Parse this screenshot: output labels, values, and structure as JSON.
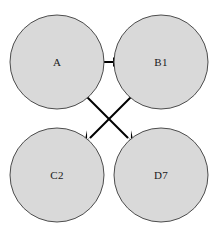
{
  "diagram": {
    "background_color": "#ffffff",
    "node_fill_color": "#d9d9d9",
    "node_stroke_color": "#4d4d4d",
    "edge_color": "#000000",
    "label_color": "#1a1a1a",
    "nodes": [
      {
        "id": "A",
        "label": "A",
        "cx": 57,
        "cy": 62,
        "r": 47
      },
      {
        "id": "B1",
        "label": "B1",
        "cx": 161,
        "cy": 62,
        "r": 47
      },
      {
        "id": "C2",
        "label": "C2",
        "cx": 57,
        "cy": 175,
        "r": 47
      },
      {
        "id": "D7",
        "label": "D7",
        "cx": 161,
        "cy": 175,
        "r": 47
      }
    ],
    "edges": [
      {
        "id": "a-to-b1",
        "from": "A",
        "to": "B1",
        "directed": true,
        "x1": 95,
        "y1": 62,
        "x2": 122,
        "y2": 62
      },
      {
        "id": "a-to-d7",
        "from": "A",
        "to": "D7",
        "directed": true,
        "x1": 84,
        "y1": 94,
        "x2": 133,
        "y2": 143
      },
      {
        "id": "b1-to-c2",
        "from": "B1",
        "to": "C2",
        "directed": true,
        "x1": 134,
        "y1": 94,
        "x2": 85,
        "y2": 143
      }
    ]
  }
}
